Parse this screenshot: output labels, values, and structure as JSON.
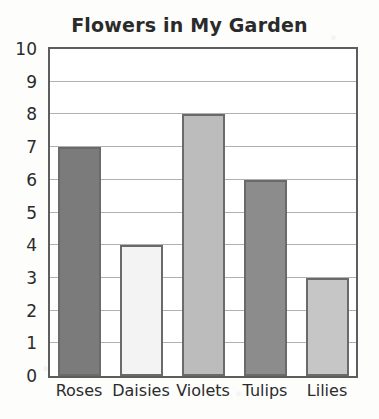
{
  "chart_data": {
    "type": "bar",
    "title": "Flowers in My Garden",
    "xlabel": "",
    "ylabel": "",
    "categories": [
      "Roses",
      "Daisies",
      "Violets",
      "Tulips",
      "Lilies"
    ],
    "values": [
      7,
      4,
      8,
      6,
      3
    ],
    "ylim": [
      0,
      10
    ],
    "y_ticks": [
      0,
      1,
      2,
      3,
      4,
      5,
      6,
      7,
      8,
      9,
      10
    ],
    "y_tick_labels": [
      "0",
      "1",
      "2",
      "3",
      "4",
      "5",
      "6",
      "7",
      "8",
      "9",
      "10"
    ],
    "grid": true,
    "legend": "none",
    "bar_colors": [
      "#7b7b7b",
      "#f3f3f3",
      "#bcbcbc",
      "#8c8c8c",
      "#c6c6c6"
    ],
    "bar_edge_color": "#6a6a6a",
    "axis_color": "#5d5d5d",
    "gridline_color": "#b0b0b0",
    "plot_background": "#ffffff",
    "page_background": "#fdfdfc",
    "text_color": "#2b2b2b"
  }
}
